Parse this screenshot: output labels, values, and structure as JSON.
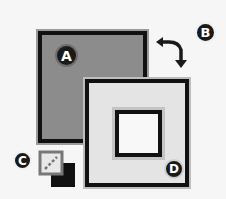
{
  "swatches": {
    "foreground": {
      "label": "A",
      "color": "#8c8c8c"
    },
    "background": {
      "label": "D",
      "color": "#e4e4e4"
    }
  },
  "controls": {
    "swap_colors": {
      "label": "B",
      "icon": "swap-arrows-icon"
    },
    "default_colors": {
      "label": "C",
      "icon": "default-colors-icon"
    }
  },
  "colors": {
    "border": "#111111",
    "page_background": "#f6f6f6"
  }
}
